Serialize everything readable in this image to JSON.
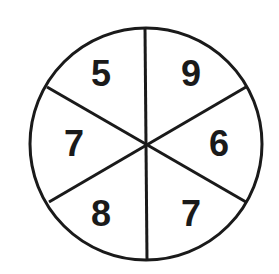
{
  "diagram": {
    "type": "spinner-wheel",
    "sections": [
      {
        "label": "5",
        "position": "upper-left"
      },
      {
        "label": "9",
        "position": "upper-right"
      },
      {
        "label": "6",
        "position": "right"
      },
      {
        "label": "7",
        "position": "lower-right"
      },
      {
        "label": "8",
        "position": "lower-left"
      },
      {
        "label": "7",
        "position": "left"
      }
    ],
    "colors": {
      "stroke": "#1a1a1a",
      "fill": "#ffffff"
    }
  }
}
